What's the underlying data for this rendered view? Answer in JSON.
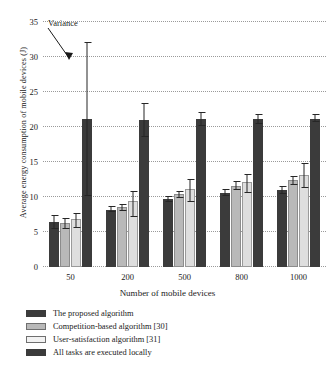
{
  "chart_data": {
    "type": "bar",
    "title": "",
    "xlabel": "Number of mobile devices",
    "ylabel": "Average energy consumption of mobile devices (J)",
    "categories": [
      "50",
      "200",
      "500",
      "800",
      "1000"
    ],
    "ylim": [
      0,
      35
    ],
    "yticks": [
      0,
      5,
      10,
      15,
      20,
      25,
      30,
      35
    ],
    "grid": true,
    "legend_position": "below-plot",
    "annotations": [
      {
        "text": "Variance",
        "points_to": "error-bar-of-all-tasks-executed-locally-at-50"
      }
    ],
    "series": [
      {
        "name": "The proposed algorithm",
        "color": "#3b3b3b",
        "values": [
          6.4,
          8.2,
          9.7,
          10.6,
          11.0
        ],
        "err_low": [
          5.5,
          7.8,
          9.3,
          10.1,
          10.5
        ],
        "err_high": [
          7.4,
          8.7,
          10.1,
          11.2,
          11.6
        ]
      },
      {
        "name": "Competition-based algorithm [30]",
        "color": "#b9b9b9",
        "values": [
          6.3,
          8.6,
          10.5,
          11.6,
          12.4
        ],
        "err_low": [
          5.6,
          8.1,
          10.0,
          11.2,
          11.8
        ],
        "err_high": [
          7.2,
          9.2,
          11.0,
          12.4,
          13.2
        ]
      },
      {
        "name": "User-satisfaction algorithm [31]",
        "color": "#dedede",
        "values": [
          6.8,
          9.4,
          11.2,
          12.2,
          13.2
        ],
        "err_low": [
          5.7,
          7.3,
          9.5,
          10.7,
          11.5
        ],
        "err_high": [
          7.8,
          11.0,
          12.7,
          13.4,
          15.0
        ]
      },
      {
        "name": "All tasks are executed locally",
        "color": "#3b3b3b",
        "values": [
          21.2,
          21.0,
          21.1,
          21.1,
          21.2
        ],
        "err_low": [
          10.2,
          18.6,
          20.2,
          20.5,
          20.7
        ],
        "err_high": [
          32.2,
          23.4,
          22.2,
          21.8,
          21.8
        ]
      }
    ]
  },
  "legend": {
    "items": [
      "The proposed algorithm",
      "Competition-based algorithm [30]",
      "User-satisfaction algorithm [31]",
      "All tasks are executed locally"
    ]
  },
  "annotation": {
    "variance_label": "Variance"
  }
}
